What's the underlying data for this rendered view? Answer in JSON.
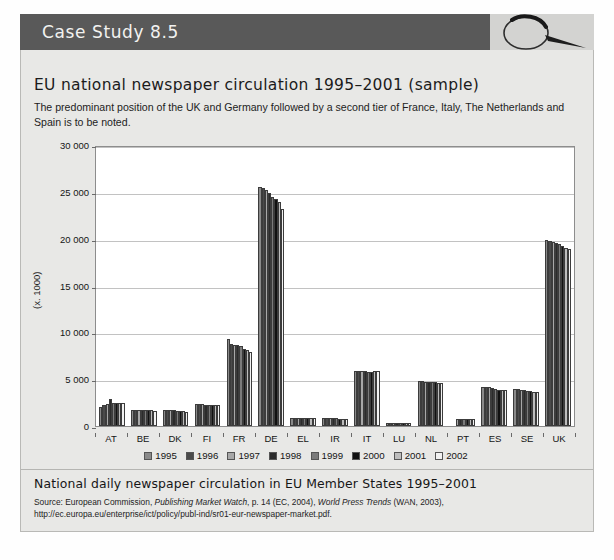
{
  "header": {
    "label": "Case Study 8.5",
    "icon": "magnifier-icon"
  },
  "chart_title": "EU national newspaper circulation 1995–2001 (sample)",
  "intro": "The predominant position of the UK and Germany followed by a second tier of France, Italy, The Netherlands and Spain is to be noted.",
  "footer": {
    "caption": "National daily newspaper circulation in EU Member States 1995–2001",
    "source_prefix": "Source: European Commission, ",
    "source_italic1": "Publishing Market Watch",
    "source_mid": ", p. 14 (EC, 2004), ",
    "source_italic2": "World Press Trends",
    "source_suffix": " (WAN, 2003), http://ec.europa.eu/enterprise/ict/policy/publ-ind/sr01-eur-newspaper-market.pdf."
  },
  "chart_data": {
    "type": "bar",
    "title": "EU national newspaper circulation 1995–2001 (sample)",
    "xlabel": "",
    "ylabel": "(x. 1000)",
    "ylim": [
      0,
      30000
    ],
    "yticks": [
      0,
      5000,
      10000,
      15000,
      20000,
      25000,
      30000
    ],
    "ytick_labels": [
      "0",
      "5 000",
      "10 000",
      "15 000",
      "20 000",
      "25 000",
      "30 000"
    ],
    "grid": true,
    "legend_position": "bottom",
    "categories": [
      "AT",
      "BE",
      "DK",
      "FI",
      "FR",
      "DE",
      "EL",
      "IR",
      "IT",
      "LU",
      "NL",
      "PT",
      "ES",
      "SE",
      "UK"
    ],
    "series": [
      {
        "name": "1995",
        "color": "#8a8a8a",
        "values": [
          2000,
          1720,
          1760,
          2330,
          9300,
          25500,
          870,
          820,
          5900,
          350,
          4800,
          0,
          4180,
          3950,
          19900
        ]
      },
      {
        "name": "1996",
        "color": "#4a4a4a",
        "values": [
          2200,
          1730,
          1750,
          2340,
          8800,
          25450,
          880,
          830,
          5880,
          350,
          4770,
          0,
          4170,
          3900,
          19800
        ]
      },
      {
        "name": "1997",
        "color": "#a8a8a8",
        "values": [
          2350,
          1700,
          1700,
          2320,
          8700,
          25250,
          880,
          840,
          5850,
          345,
          4750,
          760,
          4150,
          3850,
          19600
        ]
      },
      {
        "name": "1998",
        "color": "#2b2b2b",
        "values": [
          2850,
          1690,
          1680,
          2270,
          8650,
          24900,
          870,
          830,
          5830,
          340,
          4700,
          760,
          4050,
          3800,
          19500
        ]
      },
      {
        "name": "1999",
        "color": "#7b7b7b",
        "values": [
          2480,
          1690,
          1640,
          2260,
          8500,
          24500,
          860,
          820,
          5820,
          340,
          4680,
          740,
          3900,
          3720,
          19400
        ]
      },
      {
        "name": "2000",
        "color": "#111111",
        "values": [
          2450,
          1680,
          1600,
          2250,
          8200,
          24200,
          850,
          800,
          5800,
          335,
          4650,
          730,
          3880,
          3700,
          19250
        ]
      },
      {
        "name": "2001",
        "color": "#bdbdbd",
        "values": [
          2430,
          1660,
          1560,
          2240,
          8150,
          23900,
          840,
          790,
          5830,
          330,
          4620,
          720,
          3860,
          3680,
          19050
        ]
      },
      {
        "name": "2002",
        "color": "#f2f2f2",
        "values": [
          2420,
          1640,
          1520,
          2230,
          7850,
          23200,
          830,
          780,
          5850,
          330,
          4600,
          710,
          3840,
          3660,
          18900
        ]
      }
    ]
  }
}
